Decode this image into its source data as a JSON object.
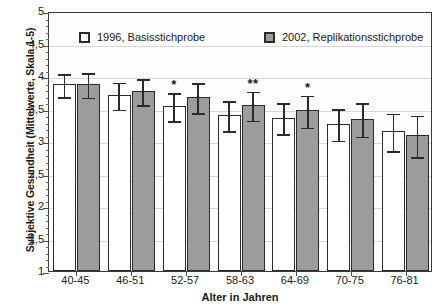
{
  "chart_data": {
    "type": "bar",
    "title": "",
    "xlabel": "Alter in Jahren",
    "ylabel": "Subjektive Gesundheit (Mittelwerte, Skala 1-5)",
    "ylim": [
      1,
      5
    ],
    "ytick_labels": [
      "1",
      "1,5",
      "2",
      "2,5",
      "3",
      "3,5",
      "4",
      "4,5",
      "5"
    ],
    "ytick_values": [
      1,
      1.5,
      2,
      2.5,
      3,
      3.5,
      4,
      4.5,
      5
    ],
    "grid": true,
    "legend_position": "top-inside",
    "categories": [
      "40-45",
      "46-51",
      "52-57",
      "58-63",
      "64-69",
      "70-75",
      "76-81"
    ],
    "series": [
      {
        "name": "1996, Basisstichprobe",
        "color": "#ffffff",
        "values": [
          3.87,
          3.71,
          3.54,
          3.4,
          3.36,
          3.26,
          3.15
        ],
        "errors_low": [
          3.68,
          3.49,
          3.31,
          3.16,
          3.11,
          3.01,
          2.85
        ],
        "errors_high": [
          4.06,
          3.93,
          3.77,
          3.64,
          3.61,
          3.52,
          3.45
        ]
      },
      {
        "name": "2002, Replikationsstichprobe",
        "color": "#9c9c9c",
        "values": [
          3.87,
          3.77,
          3.67,
          3.56,
          3.47,
          3.34,
          3.09
        ],
        "errors_low": [
          3.67,
          3.56,
          3.43,
          3.32,
          3.21,
          3.07,
          2.76
        ],
        "errors_high": [
          4.07,
          3.98,
          3.92,
          3.79,
          3.73,
          3.61,
          3.42
        ]
      }
    ],
    "annotations": [
      {
        "label": "*",
        "category": "52-57",
        "series": "1996, Basisstichprobe"
      },
      {
        "label": "**",
        "category": "58-63",
        "series": "2002, Replikationsstichprobe"
      },
      {
        "label": "*",
        "category": "64-69",
        "series": "2002, Replikationsstichprobe"
      }
    ]
  }
}
